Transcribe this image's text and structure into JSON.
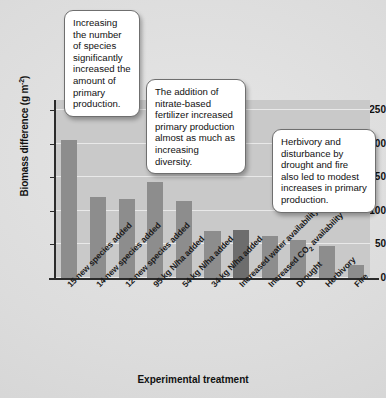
{
  "chart_data": {
    "type": "bar",
    "title": "",
    "xlabel": "Experimental treatment",
    "ylabel": "Biomass difference (g m",
    "ylabel_exponent": "-2",
    "ylabel_suffix": ")",
    "ylim": [
      0,
      265
    ],
    "yticks": [
      0,
      50,
      100,
      150,
      200,
      250
    ],
    "grid": true,
    "legend": "none",
    "categories": [
      "15 new species added",
      "14 new species added",
      "12 new species added",
      "95 kg N/ha added",
      "54 kg N/ha added",
      "34 kg N/ha added",
      "Increased water availability",
      "Increased CO2 availability",
      "Drought",
      "Herbivory",
      "Fire"
    ],
    "category_labels_html": [
      "15 new species added",
      "14 new species added",
      "12 new species added",
      "95 kg N/ha added",
      "54 kg N/ha added",
      "34 kg N/ha added",
      "Increased water availability",
      "Increased CO₂ availability",
      "Drought",
      "Herbivory",
      "Fire"
    ],
    "values": [
      206,
      120,
      118,
      143,
      115,
      70,
      72,
      63,
      56,
      48,
      20
    ],
    "bar_colors": [
      "#8d8d8d",
      "#8d8d8d",
      "#8d8d8d",
      "#8d8d8d",
      "#8d8d8d",
      "#8d8d8d",
      "#6d6d6d",
      "#8d8d8d",
      "#8d8d8d",
      "#8d8d8d",
      "#8d8d8d"
    ],
    "plot_background": "#c9c9c9",
    "page_background": "#dedede",
    "gridline_color": "#e9e9e9",
    "axis_color": "#2b2b2b"
  },
  "callouts": [
    {
      "id": "callout-1",
      "text": "Increasing the number of species significantly increased the amount of primary production."
    },
    {
      "id": "callout-2",
      "text": "The addition of nitrate-based fertilizer increased primary production almost as much as increasing diversity."
    },
    {
      "id": "callout-3",
      "text": "Herbivory and disturbance by drought and fire also led to modest increases in primary production."
    }
  ]
}
